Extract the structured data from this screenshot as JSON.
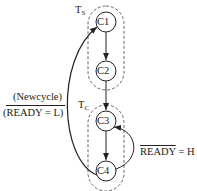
{
  "diagram": {
    "groups": [
      {
        "id": "ts",
        "label_main": "T",
        "label_sub": "S"
      },
      {
        "id": "tc",
        "label_main": "T",
        "label_sub": "C"
      }
    ],
    "nodes": [
      {
        "id": "C1",
        "label": "C1"
      },
      {
        "id": "C2",
        "label": "C2"
      },
      {
        "id": "C3",
        "label": "C3"
      },
      {
        "id": "C4",
        "label": "C4"
      }
    ],
    "edges": [
      {
        "from": "C1",
        "to": "C2"
      },
      {
        "from": "C2",
        "to": "C3"
      },
      {
        "from": "C3",
        "to": "C4"
      },
      {
        "from": "C4",
        "to": "C3",
        "label": "READY = H",
        "label_overlined_part": "READY",
        "label_rest": " = H"
      },
      {
        "from": "C4",
        "to": "C1",
        "label_top": "(Newcycle)",
        "label_bottom": "(READY = L)"
      }
    ],
    "colors": {
      "stroke": "#222222",
      "dashed": "#555555",
      "background": "#ffffff"
    }
  }
}
